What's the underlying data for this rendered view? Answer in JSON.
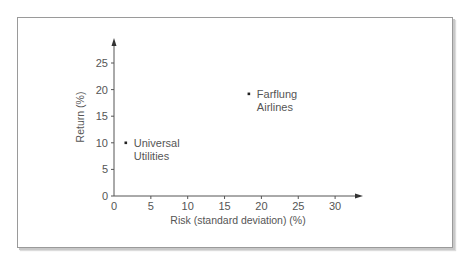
{
  "chart_data": {
    "type": "scatter",
    "title": "",
    "xlabel": "Risk (standard deviation) (%)",
    "ylabel": "Return (%)",
    "xlim": [
      0,
      33
    ],
    "ylim": [
      0,
      28
    ],
    "x_ticks": [
      0,
      5,
      10,
      15,
      20,
      25,
      30
    ],
    "y_ticks": [
      0,
      5,
      10,
      15,
      20,
      25
    ],
    "grid": false,
    "legend": null,
    "points": [
      {
        "label_line1": "Universal",
        "label_line2": "Utilities",
        "x": 1.6,
        "y": 10
      },
      {
        "label_line1": "Farflung",
        "label_line2": "Airlines",
        "x": 18.3,
        "y": 19.2
      }
    ]
  },
  "colors": {
    "axis": "#555555",
    "text": "#555555",
    "point": "#222222",
    "frame": "#9a9a9a"
  }
}
